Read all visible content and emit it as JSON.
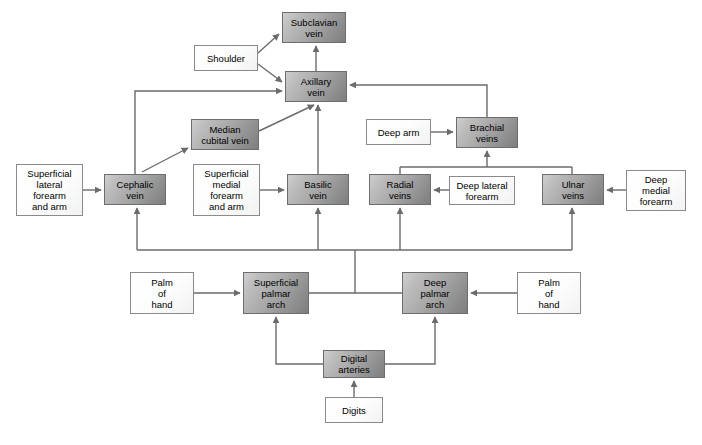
{
  "figure": {
    "type": "flow-diagram",
    "caption": "",
    "colors": {
      "vessel_fill_light": "#cfcfcf",
      "vessel_fill_dark": "#7e7e7e",
      "vessel_border": "#6d6d6d",
      "plain_fill": "#ffffff",
      "plain_border": "#8a8a8a",
      "connector": "#6b6b6b",
      "background": "#ffffff"
    }
  },
  "nodes": [
    {
      "id": "subclavian",
      "label": "Subclavian\nvein",
      "kind": "vessel",
      "x": 282,
      "y": 12,
      "w": 64,
      "h": 31
    },
    {
      "id": "shoulder",
      "label": "Shoulder",
      "kind": "plain",
      "x": 194,
      "y": 45,
      "w": 64,
      "h": 26
    },
    {
      "id": "axillary",
      "label": "Axillary\nvein",
      "kind": "vessel",
      "x": 285,
      "y": 71,
      "w": 62,
      "h": 31
    },
    {
      "id": "median-cubital",
      "label": "Median\ncubital vein",
      "kind": "vessel",
      "x": 191,
      "y": 119,
      "w": 68,
      "h": 31
    },
    {
      "id": "brachial",
      "label": "Brachial\nveins",
      "kind": "vessel",
      "x": 456,
      "y": 117,
      "w": 62,
      "h": 31
    },
    {
      "id": "deep-arm",
      "label": "Deep arm",
      "kind": "plain",
      "x": 366,
      "y": 119,
      "w": 65,
      "h": 26
    },
    {
      "id": "superficial-lateral",
      "label": "Superficial\nlateral\nforearm\nand arm",
      "kind": "plain",
      "x": 16,
      "y": 164,
      "w": 67,
      "h": 52
    },
    {
      "id": "cephalic",
      "label": "Cephalic\nvein",
      "kind": "vessel",
      "x": 104,
      "y": 174,
      "w": 62,
      "h": 31
    },
    {
      "id": "superficial-medial",
      "label": "Superficial\nmedial\nforearm\nand arm",
      "kind": "plain",
      "x": 193,
      "y": 164,
      "w": 67,
      "h": 52
    },
    {
      "id": "basilic",
      "label": "Basilic\nvein",
      "kind": "vessel",
      "x": 287,
      "y": 174,
      "w": 62,
      "h": 31
    },
    {
      "id": "radial",
      "label": "Radial\nveins",
      "kind": "vessel",
      "x": 369,
      "y": 174,
      "w": 62,
      "h": 31
    },
    {
      "id": "deep-lateral",
      "label": "Deep lateral\nforearm",
      "kind": "plain",
      "x": 449,
      "y": 176,
      "w": 66,
      "h": 29
    },
    {
      "id": "ulnar",
      "label": "Ulnar\nveins",
      "kind": "vessel",
      "x": 542,
      "y": 174,
      "w": 62,
      "h": 31
    },
    {
      "id": "deep-medial",
      "label": "Deep\nmedial\nforearm",
      "kind": "plain",
      "x": 626,
      "y": 170,
      "w": 60,
      "h": 41
    },
    {
      "id": "palm-left",
      "label": "Palm\nof\nhand",
      "kind": "plain",
      "x": 130,
      "y": 272,
      "w": 64,
      "h": 42
    },
    {
      "id": "superficial-palmar",
      "label": "Superficial\npalmar\narch",
      "kind": "vessel",
      "x": 243,
      "y": 272,
      "w": 66,
      "h": 42
    },
    {
      "id": "deep-palmar",
      "label": "Deep\npalmar\narch",
      "kind": "vessel",
      "x": 402,
      "y": 272,
      "w": 66,
      "h": 42
    },
    {
      "id": "palm-right",
      "label": "Palm\nof\nhand",
      "kind": "plain",
      "x": 517,
      "y": 272,
      "w": 64,
      "h": 42
    },
    {
      "id": "digital-arteries",
      "label": "Digital\narteries",
      "kind": "vessel",
      "x": 323,
      "y": 350,
      "w": 62,
      "h": 28
    },
    {
      "id": "digits",
      "label": "Digits",
      "kind": "plain",
      "x": 325,
      "y": 397,
      "w": 58,
      "h": 26
    }
  ],
  "edges": [
    {
      "from": "shoulder",
      "to": "subclavian",
      "style": "diagonal"
    },
    {
      "from": "shoulder",
      "to": "axillary",
      "style": "diagonal"
    },
    {
      "from": "axillary",
      "to": "subclavian",
      "style": "straight-up"
    },
    {
      "from": "cephalic",
      "to": "axillary",
      "style": "up-then-right"
    },
    {
      "from": "cephalic",
      "to": "median-cubital",
      "style": "diagonal"
    },
    {
      "from": "median-cubital",
      "to": "axillary",
      "style": "diagonal"
    },
    {
      "from": "basilic",
      "to": "axillary",
      "style": "straight-up"
    },
    {
      "from": "brachial",
      "to": "axillary",
      "style": "up-then-left"
    },
    {
      "from": "deep-arm",
      "to": "brachial",
      "style": "straight-right"
    },
    {
      "from": "radial",
      "to": "brachial",
      "style": "bus-up"
    },
    {
      "from": "ulnar",
      "to": "brachial",
      "style": "bus-up"
    },
    {
      "from": "superficial-lateral",
      "to": "cephalic",
      "style": "straight-right"
    },
    {
      "from": "superficial-medial",
      "to": "basilic",
      "style": "straight-right"
    },
    {
      "from": "deep-lateral",
      "to": "radial",
      "style": "straight-left"
    },
    {
      "from": "deep-medial",
      "to": "ulnar",
      "style": "straight-left"
    },
    {
      "from": "palmar-bus",
      "to": "cephalic",
      "style": "bus-up"
    },
    {
      "from": "palmar-bus",
      "to": "basilic",
      "style": "bus-up"
    },
    {
      "from": "palmar-bus",
      "to": "radial",
      "style": "bus-up"
    },
    {
      "from": "palmar-bus",
      "to": "ulnar",
      "style": "bus-up"
    },
    {
      "from": "superficial-palmar",
      "to": "palmar-bus",
      "style": "bus-join"
    },
    {
      "from": "deep-palmar",
      "to": "palmar-bus",
      "style": "bus-join"
    },
    {
      "from": "palm-left",
      "to": "superficial-palmar",
      "style": "straight-right"
    },
    {
      "from": "palm-right",
      "to": "deep-palmar",
      "style": "straight-left"
    },
    {
      "from": "digital-arteries",
      "to": "superficial-palmar",
      "style": "left-then-up"
    },
    {
      "from": "digital-arteries",
      "to": "deep-palmar",
      "style": "right-then-up"
    },
    {
      "from": "digits",
      "to": "digital-arteries",
      "style": "straight-up"
    }
  ]
}
